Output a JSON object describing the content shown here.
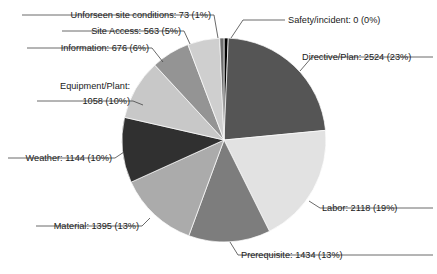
{
  "chart_data": {
    "type": "pie",
    "title": "",
    "xlabel": "",
    "ylabel": "",
    "total": 10985,
    "start_angle_deg": 0,
    "direction": "clockwise",
    "legend": "none",
    "grid": false,
    "categories": [
      "Safety/incident",
      "Directive/Plan",
      "Labor",
      "Prerequisite",
      "Material",
      "Weather",
      "Equipment/Plant",
      "Information",
      "Site Access",
      "Unforseen site conditions"
    ],
    "values": [
      0,
      2524,
      2118,
      1434,
      1395,
      1144,
      1058,
      676,
      563,
      73
    ],
    "percents": [
      0,
      23,
      19,
      13,
      13,
      10,
      10,
      6,
      5,
      1
    ],
    "colors": [
      "#000000",
      "#555555",
      "#e2e2e2",
      "#7d7d7d",
      "#ababab",
      "#303030",
      "#c8c8c8",
      "#949494",
      "#cfcfcf",
      "#6e6e6e"
    ],
    "slices": [
      {
        "name": "safety-incident",
        "label": "Safety/incident: 0 (0%)",
        "category": "Safety/incident",
        "value": 0,
        "percent": 0,
        "color": "#000000"
      },
      {
        "name": "directive-plan",
        "label": "Directive/Plan: 2524 (23%)",
        "category": "Directive/Plan",
        "value": 2524,
        "percent": 23,
        "color": "#555555"
      },
      {
        "name": "labor",
        "label": "Labor: 2118 (19%)",
        "category": "Labor",
        "value": 2118,
        "percent": 19,
        "color": "#e2e2e2"
      },
      {
        "name": "prerequisite",
        "label": "Prerequisite: 1434 (13%)",
        "category": "Prerequisite",
        "value": 1434,
        "percent": 13,
        "color": "#7d7d7d"
      },
      {
        "name": "material",
        "label": "Material: 1395 (13%)",
        "category": "Material",
        "value": 1395,
        "percent": 13,
        "color": "#ababab"
      },
      {
        "name": "weather",
        "label": "Weather: 1144 (10%)",
        "category": "Weather",
        "value": 1144,
        "percent": 10,
        "color": "#303030"
      },
      {
        "name": "equipment-plant",
        "label": "Equipment/Plant: 1058 (10%)",
        "label_line1": "Equipment/Plant:",
        "label_line2": "1058 (10%)",
        "category": "Equipment/Plant",
        "value": 1058,
        "percent": 10,
        "color": "#c8c8c8"
      },
      {
        "name": "information",
        "label": "Information: 676 (6%)",
        "category": "Information",
        "value": 676,
        "percent": 6,
        "color": "#949494"
      },
      {
        "name": "site-access",
        "label": "Site Access: 563 (5%)",
        "category": "Site Access",
        "value": 563,
        "percent": 5,
        "color": "#cfcfcf"
      },
      {
        "name": "unforseen-site-conditions",
        "label": "Unforseen site conditions: 73 (1%)",
        "category": "Unforseen site conditions",
        "value": 73,
        "percent": 1,
        "color": "#6e6e6e"
      }
    ]
  }
}
